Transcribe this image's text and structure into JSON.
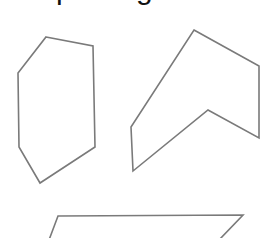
{
  "caption": {
    "text": "pentagon"
  },
  "style": {
    "stroke_color": "#7a7a7a",
    "stroke_width": 1.6,
    "background": "#ffffff"
  },
  "shapes": [
    {
      "name": "hexagon",
      "points": "46,37 93,46 95,147 40,183 19,147 18,73"
    },
    {
      "name": "chevron-hexagon",
      "points": "194,30 259,66 259,138 208,110 133,171 131,127"
    },
    {
      "name": "parallelogram",
      "points": "58,216 243,215 219,240 49,240"
    }
  ]
}
